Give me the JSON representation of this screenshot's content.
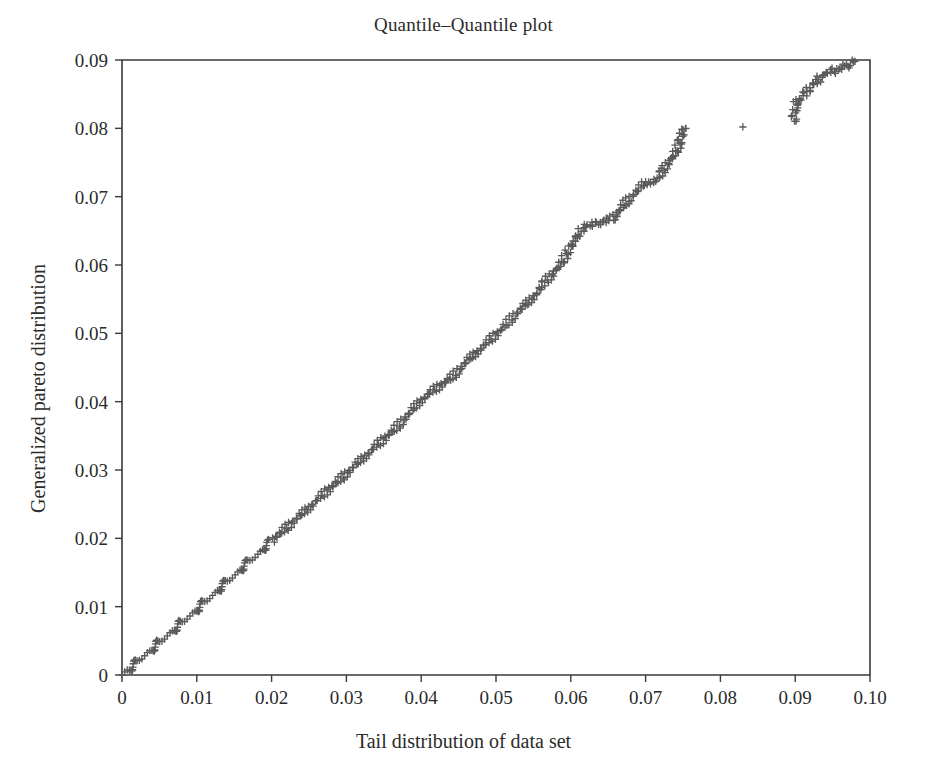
{
  "chart_data": {
    "type": "scatter",
    "title": "Quantile–Quantile plot",
    "xlabel": "Tail distribution of data set",
    "ylabel": "Generalized pareto distribution",
    "xlim": [
      0,
      0.1
    ],
    "ylim": [
      0,
      0.09
    ],
    "grid": false,
    "legend": null,
    "marker": "+",
    "marker_color": "#5a5a5a",
    "xticks": [
      0,
      0.01,
      0.02,
      0.03,
      0.04,
      0.05,
      0.06,
      0.07,
      0.08,
      0.09,
      0.1
    ],
    "xticklabels": [
      "0",
      "0.01",
      "0.02",
      "0.03",
      "0.04",
      "0.05",
      "0.06",
      "0.07",
      "0.08",
      "0.09",
      "0.10"
    ],
    "yticks": [
      0,
      0.01,
      0.02,
      0.03,
      0.04,
      0.05,
      0.06,
      0.07,
      0.08,
      0.09
    ],
    "yticklabels": [
      "0",
      "0.01",
      "0.02",
      "0.03",
      "0.04",
      "0.05",
      "0.06",
      "0.07",
      "0.08",
      "0.09"
    ],
    "series": [
      {
        "name": "quantile-pairs",
        "points": [
          [
            0.0,
            0.0
          ],
          [
            0.0002,
            0.0002
          ],
          [
            0.0004,
            0.0004
          ],
          [
            0.0006,
            0.0005
          ],
          [
            0.0008,
            0.0007
          ],
          [
            0.001,
            0.0009
          ],
          [
            0.0012,
            0.0011
          ],
          [
            0.0014,
            0.0013
          ],
          [
            0.0016,
            0.0015
          ],
          [
            0.0018,
            0.0017
          ],
          [
            0.002,
            0.0019
          ],
          [
            0.0022,
            0.0021
          ],
          [
            0.0024,
            0.0023
          ],
          [
            0.0026,
            0.0025
          ],
          [
            0.0028,
            0.0026
          ],
          [
            0.003,
            0.0028
          ],
          [
            0.0032,
            0.003
          ],
          [
            0.0034,
            0.0032
          ],
          [
            0.0036,
            0.0034
          ],
          [
            0.0038,
            0.0036
          ],
          [
            0.004,
            0.0038
          ],
          [
            0.0042,
            0.004
          ],
          [
            0.0044,
            0.0042
          ],
          [
            0.0046,
            0.0044
          ],
          [
            0.0048,
            0.0046
          ],
          [
            0.005,
            0.0048
          ],
          [
            0.0052,
            0.0049
          ],
          [
            0.0054,
            0.0051
          ],
          [
            0.0056,
            0.0053
          ],
          [
            0.0058,
            0.0055
          ],
          [
            0.006,
            0.0057
          ],
          [
            0.0062,
            0.0059
          ],
          [
            0.0064,
            0.0061
          ],
          [
            0.0066,
            0.0063
          ],
          [
            0.0068,
            0.0065
          ],
          [
            0.007,
            0.0067
          ],
          [
            0.0072,
            0.0069
          ],
          [
            0.0074,
            0.0071
          ],
          [
            0.0076,
            0.0073
          ],
          [
            0.0078,
            0.0075
          ],
          [
            0.008,
            0.0077
          ],
          [
            0.0082,
            0.0078
          ],
          [
            0.0084,
            0.008
          ],
          [
            0.0086,
            0.0082
          ],
          [
            0.0088,
            0.0084
          ],
          [
            0.009,
            0.0086
          ],
          [
            0.0092,
            0.0088
          ],
          [
            0.0094,
            0.009
          ],
          [
            0.0096,
            0.0092
          ],
          [
            0.0098,
            0.0094
          ],
          [
            0.01,
            0.0096
          ],
          [
            0.0102,
            0.0098
          ],
          [
            0.0104,
            0.01
          ],
          [
            0.0106,
            0.0102
          ],
          [
            0.0108,
            0.0104
          ],
          [
            0.011,
            0.0106
          ],
          [
            0.0112,
            0.0108
          ],
          [
            0.0114,
            0.011
          ],
          [
            0.0116,
            0.0112
          ],
          [
            0.0118,
            0.0114
          ],
          [
            0.012,
            0.0116
          ],
          [
            0.0122,
            0.0118
          ],
          [
            0.0124,
            0.012
          ],
          [
            0.0126,
            0.0122
          ],
          [
            0.0128,
            0.0124
          ],
          [
            0.013,
            0.0126
          ],
          [
            0.0132,
            0.0128
          ],
          [
            0.0134,
            0.013
          ],
          [
            0.0136,
            0.0132
          ],
          [
            0.0138,
            0.0134
          ],
          [
            0.014,
            0.0136
          ],
          [
            0.0142,
            0.0138
          ],
          [
            0.0144,
            0.014
          ],
          [
            0.0146,
            0.0142
          ],
          [
            0.0148,
            0.0144
          ],
          [
            0.015,
            0.0146
          ],
          [
            0.0152,
            0.0148
          ],
          [
            0.0154,
            0.015
          ],
          [
            0.0156,
            0.0152
          ],
          [
            0.0158,
            0.0154
          ],
          [
            0.016,
            0.0156
          ],
          [
            0.0162,
            0.0158
          ],
          [
            0.0164,
            0.016
          ],
          [
            0.0166,
            0.0162
          ],
          [
            0.0168,
            0.0164
          ],
          [
            0.017,
            0.0166
          ],
          [
            0.0172,
            0.0168
          ],
          [
            0.0174,
            0.017
          ],
          [
            0.0176,
            0.0172
          ],
          [
            0.0178,
            0.0174
          ],
          [
            0.018,
            0.0176
          ],
          [
            0.0182,
            0.0178
          ],
          [
            0.0184,
            0.018
          ],
          [
            0.0186,
            0.0182
          ],
          [
            0.0188,
            0.0184
          ],
          [
            0.019,
            0.0186
          ],
          [
            0.0192,
            0.0188
          ],
          [
            0.0194,
            0.019
          ],
          [
            0.0196,
            0.0192
          ],
          [
            0.0198,
            0.0194
          ],
          [
            0.02,
            0.0196
          ],
          [
            0.0205,
            0.0201
          ],
          [
            0.021,
            0.0206
          ],
          [
            0.0215,
            0.0211
          ],
          [
            0.022,
            0.0216
          ],
          [
            0.0225,
            0.0221
          ],
          [
            0.023,
            0.0226
          ],
          [
            0.0235,
            0.023
          ],
          [
            0.024,
            0.0235
          ],
          [
            0.0245,
            0.024
          ],
          [
            0.025,
            0.0245
          ],
          [
            0.0255,
            0.025
          ],
          [
            0.026,
            0.0255
          ],
          [
            0.0265,
            0.026
          ],
          [
            0.027,
            0.0265
          ],
          [
            0.0275,
            0.027
          ],
          [
            0.028,
            0.0275
          ],
          [
            0.0285,
            0.028
          ],
          [
            0.029,
            0.0285
          ],
          [
            0.0295,
            0.029
          ],
          [
            0.03,
            0.0295
          ],
          [
            0.0305,
            0.03
          ],
          [
            0.031,
            0.0305
          ],
          [
            0.0315,
            0.031
          ],
          [
            0.032,
            0.0315
          ],
          [
            0.0325,
            0.032
          ],
          [
            0.033,
            0.0325
          ],
          [
            0.0335,
            0.033
          ],
          [
            0.034,
            0.0335
          ],
          [
            0.0345,
            0.034
          ],
          [
            0.035,
            0.0345
          ],
          [
            0.0355,
            0.035
          ],
          [
            0.036,
            0.0355
          ],
          [
            0.0365,
            0.036
          ],
          [
            0.037,
            0.0366
          ],
          [
            0.0375,
            0.0372
          ],
          [
            0.038,
            0.0378
          ],
          [
            0.0385,
            0.0384
          ],
          [
            0.039,
            0.039
          ],
          [
            0.0395,
            0.0396
          ],
          [
            0.04,
            0.0402
          ],
          [
            0.0405,
            0.0407
          ],
          [
            0.041,
            0.0411
          ],
          [
            0.0415,
            0.0415
          ],
          [
            0.042,
            0.0419
          ],
          [
            0.0425,
            0.0423
          ],
          [
            0.043,
            0.0427
          ],
          [
            0.0435,
            0.0431
          ],
          [
            0.044,
            0.0435
          ],
          [
            0.0445,
            0.044
          ],
          [
            0.045,
            0.0446
          ],
          [
            0.0455,
            0.0452
          ],
          [
            0.046,
            0.0458
          ],
          [
            0.0465,
            0.0463
          ],
          [
            0.047,
            0.0468
          ],
          [
            0.0475,
            0.0473
          ],
          [
            0.048,
            0.0478
          ],
          [
            0.0485,
            0.0483
          ],
          [
            0.049,
            0.0488
          ],
          [
            0.0495,
            0.0493
          ],
          [
            0.05,
            0.0498
          ],
          [
            0.0505,
            0.0503
          ],
          [
            0.051,
            0.0509
          ],
          [
            0.0515,
            0.0515
          ],
          [
            0.052,
            0.0521
          ],
          [
            0.0525,
            0.0527
          ],
          [
            0.053,
            0.0532
          ],
          [
            0.0535,
            0.0537
          ],
          [
            0.054,
            0.0542
          ],
          [
            0.0545,
            0.0547
          ],
          [
            0.055,
            0.0553
          ],
          [
            0.0555,
            0.0559
          ],
          [
            0.056,
            0.0566
          ],
          [
            0.0565,
            0.0574
          ],
          [
            0.057,
            0.058
          ],
          [
            0.0575,
            0.0585
          ],
          [
            0.058,
            0.0592
          ],
          [
            0.0585,
            0.06
          ],
          [
            0.059,
            0.0608
          ],
          [
            0.0595,
            0.0617
          ],
          [
            0.06,
            0.0626
          ],
          [
            0.0605,
            0.0636
          ],
          [
            0.061,
            0.0646
          ],
          [
            0.0615,
            0.0654
          ],
          [
            0.0618,
            0.0658
          ],
          [
            0.0628,
            0.066
          ],
          [
            0.0638,
            0.0662
          ],
          [
            0.0645,
            0.0663
          ],
          [
            0.0652,
            0.0666
          ],
          [
            0.0656,
            0.0668
          ],
          [
            0.066,
            0.0672
          ],
          [
            0.0664,
            0.0678
          ],
          [
            0.0668,
            0.0684
          ],
          [
            0.0672,
            0.069
          ],
          [
            0.0676,
            0.0694
          ],
          [
            0.068,
            0.0699
          ],
          [
            0.0685,
            0.0704
          ],
          [
            0.069,
            0.071
          ],
          [
            0.0695,
            0.0716
          ],
          [
            0.07,
            0.072
          ],
          [
            0.0706,
            0.0722
          ],
          [
            0.0712,
            0.0723
          ],
          [
            0.0718,
            0.0727
          ],
          [
            0.0722,
            0.0735
          ],
          [
            0.0726,
            0.0742
          ],
          [
            0.073,
            0.0748
          ],
          [
            0.0734,
            0.0754
          ],
          [
            0.0738,
            0.0762
          ],
          [
            0.0742,
            0.077
          ],
          [
            0.0746,
            0.0778
          ],
          [
            0.075,
            0.0798
          ],
          [
            0.0754,
            0.08
          ],
          [
            0.083,
            0.0802
          ],
          [
            0.0898,
            0.081
          ],
          [
            0.0902,
            0.0838
          ],
          [
            0.0936,
            0.0878
          ],
          [
            0.0972,
            0.0893
          ],
          [
            0.098,
            0.0898
          ]
        ]
      }
    ]
  }
}
